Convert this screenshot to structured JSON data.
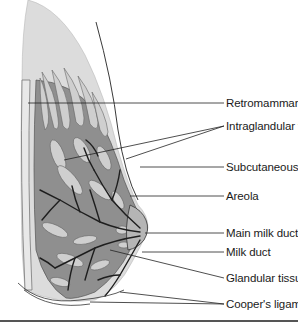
{
  "diagram": {
    "labels": [
      {
        "id": "retromammary-fat",
        "text": "Retromammary fat",
        "y": 103
      },
      {
        "id": "intraglandular-fat",
        "text": "Intraglandular fat",
        "y": 122
      },
      {
        "id": "subcutaneous-fat",
        "text": "Subcutaneous fat",
        "y": 164
      },
      {
        "id": "areola",
        "text": "Areola",
        "y": 191
      },
      {
        "id": "main-milk-duct",
        "text": "Main milk duct",
        "y": 229
      },
      {
        "id": "milk-duct",
        "text": "Milk duct",
        "y": 248
      },
      {
        "id": "glandular-tissue",
        "text": "Glandular tissue",
        "y": 272
      },
      {
        "id": "coopers-ligaments",
        "text": "Cooper's ligaments",
        "y": 300
      }
    ],
    "colors": {
      "outer_fat": "#dcdcdc",
      "glandular": "#8f8f8f",
      "fat_lobule": "#cfcfcf",
      "duct": "#1e1e1e",
      "leader_line": "#222222"
    }
  }
}
